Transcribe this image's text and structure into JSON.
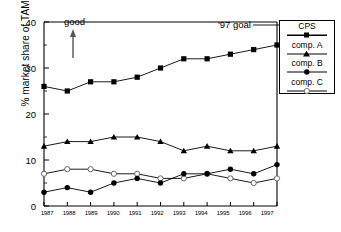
{
  "chart_data": {
    "type": "line",
    "title": "",
    "xlabel": "",
    "ylabel": "% market share of TAM",
    "categories": [
      "1987",
      "1988",
      "1989",
      "1990",
      "1991",
      "1992",
      "1993",
      "1994",
      "1995",
      "1996",
      "1997"
    ],
    "ylim": [
      0,
      40
    ],
    "yticks": [
      0,
      10,
      20,
      30,
      40
    ],
    "xlim": [
      "1987",
      "1997"
    ],
    "grid": false,
    "legend_position": "right-outside",
    "series": [
      {
        "name": "CPS",
        "marker": "filled-square",
        "values": [
          26,
          25,
          27,
          27,
          28,
          30,
          32,
          32,
          33,
          34,
          35
        ]
      },
      {
        "name": "comp. A",
        "marker": "filled-triangle",
        "values": [
          13,
          14,
          14,
          15,
          15,
          14,
          12,
          13,
          12,
          12,
          13
        ]
      },
      {
        "name": "comp. B",
        "marker": "filled-circle",
        "values": [
          3,
          4,
          3,
          5,
          6,
          5,
          7,
          7,
          8,
          7,
          9
        ]
      },
      {
        "name": "comp. C",
        "marker": "open-circle",
        "values": [
          7,
          8,
          8,
          7,
          7,
          6,
          6,
          7,
          6,
          5,
          6
        ]
      }
    ],
    "annotations": [
      {
        "id": "good",
        "text": "good",
        "note": "upward arrow beneath label at 1988"
      },
      {
        "id": "goal-97",
        "text": "'97 goal",
        "note": "leader line to legend / CPS endpoint"
      }
    ],
    "colors": {
      "ink": "#000000",
      "background": "#ffffff",
      "marker_fill": "#000000",
      "open_marker_fill": "#ffffff"
    }
  },
  "legend": {
    "items": [
      {
        "label": "CPS"
      },
      {
        "label": "comp. A"
      },
      {
        "label": "comp. B"
      },
      {
        "label": "comp. C"
      }
    ]
  },
  "axis": {
    "y_label": "% market share of TAM",
    "y_ticks": [
      "0",
      "10",
      "20",
      "30",
      "40"
    ],
    "x_ticks": [
      "1987",
      "1988",
      "1989",
      "1990",
      "1991",
      "1992",
      "1993",
      "1994",
      "1995",
      "1996",
      "1997"
    ]
  },
  "annotations": {
    "good": "good",
    "goal": "'97 goal"
  }
}
